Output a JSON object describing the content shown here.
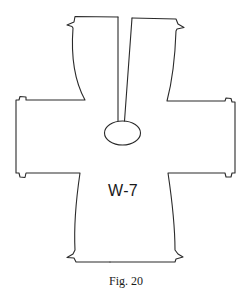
{
  "diagram": {
    "type": "sewing-pattern-piece",
    "piece_label": "W-7",
    "caption": "Fig. 20",
    "line_color": "#2a2a2a",
    "parts": [
      {
        "name": "front-slit",
        "description": "narrow tapered slit from top edge to neck opening"
      },
      {
        "name": "neck-opening",
        "description": "oval opening at end of slit"
      },
      {
        "name": "left-sleeve",
        "description": "rectangular arm extension with notch tabs"
      },
      {
        "name": "right-sleeve",
        "description": "rectangular arm extension with notch tabs"
      },
      {
        "name": "top-panels",
        "description": "two upper panels with curved sides and notches"
      },
      {
        "name": "lower-body",
        "description": "lower body panel with notched hem corners"
      }
    ]
  }
}
